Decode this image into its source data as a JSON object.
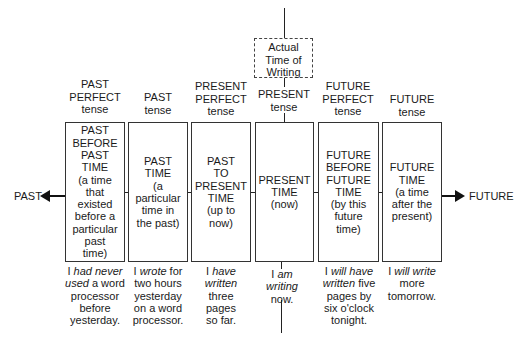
{
  "diagram": {
    "top_marker": {
      "label": "Actual\nTime of\nWriting"
    },
    "ends": {
      "left": "PAST",
      "right": "FUTURE"
    },
    "tenses": [
      {
        "tense_label": "PAST\nPERFECT\ntense",
        "box_text": "PAST\nBEFORE\nPAST\nTIME\n(a time\nthat\nexisted\nbefore a\nparticular\npast\ntime)",
        "example": [
          {
            "t": "I ",
            "i": false
          },
          {
            "t": "had never",
            "i": true
          },
          {
            "t": "\n",
            "i": false
          },
          {
            "t": "used",
            "i": true
          },
          {
            "t": " a word\nprocessor\nbefore\nyesterday.",
            "i": false
          }
        ]
      },
      {
        "tense_label": "PAST\ntense",
        "box_text": "PAST\nTIME\n(a\nparticular\ntime in\nthe past)",
        "example": [
          {
            "t": "I ",
            "i": false
          },
          {
            "t": "wrote",
            "i": true
          },
          {
            "t": " for\ntwo hours\nyesterday\non a word\nprocessor.",
            "i": false
          }
        ]
      },
      {
        "tense_label": "PRESENT\nPERFECT\ntense",
        "box_text": "PAST\nTO\nPRESENT\nTIME\n(up to\nnow)",
        "example": [
          {
            "t": "I ",
            "i": false
          },
          {
            "t": "have\nwritten",
            "i": true
          },
          {
            "t": "\nthree\npages\nso far.",
            "i": false
          }
        ]
      },
      {
        "tense_label": "PRESENT\ntense",
        "box_text": "PRESENT\nTIME\n(now)",
        "example": [
          {
            "t": "I ",
            "i": false
          },
          {
            "t": "am\nwriting",
            "i": true
          },
          {
            "t": "\nnow.",
            "i": false
          }
        ]
      },
      {
        "tense_label": "FUTURE\nPERFECT\ntense",
        "box_text": "FUTURE\nBEFORE\nFUTURE\nTIME\n(by this\nfuture\ntime)",
        "example": [
          {
            "t": "I ",
            "i": false
          },
          {
            "t": "will have\nwritten",
            "i": true
          },
          {
            "t": " five\npages by\nsix o'clock\ntonight.",
            "i": false
          }
        ]
      },
      {
        "tense_label": "FUTURE\ntense",
        "box_text": "FUTURE\nTIME\n(a time\nafter the\npresent)",
        "example": [
          {
            "t": "I ",
            "i": false
          },
          {
            "t": "will write",
            "i": true
          },
          {
            "t": "\nmore\ntomorrow.",
            "i": false
          }
        ]
      }
    ]
  }
}
